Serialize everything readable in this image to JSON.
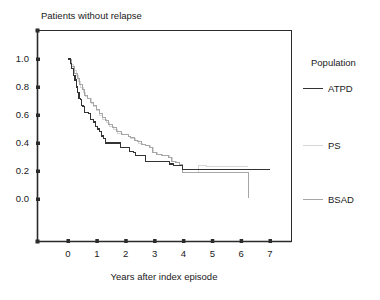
{
  "chart_data": {
    "type": "line",
    "title": "Patients without relapse",
    "xlabel": "Years after index episode",
    "ylabel": "",
    "xlim": [
      -0.45,
      7.8
    ],
    "ylim": [
      -0.18,
      1.25
    ],
    "grid": false,
    "legend_position": "right",
    "legend_title": "Population",
    "xticks": [
      0,
      1,
      2,
      3,
      4,
      5,
      6,
      7
    ],
    "xtick_labels": [
      "0",
      "1",
      "2",
      "3",
      "4",
      "5",
      "6",
      "7"
    ],
    "yticks": [
      0.0,
      0.2,
      0.4,
      0.6,
      0.8,
      1.0
    ],
    "ytick_labels": [
      "0.0",
      "0.2",
      "0.4",
      "0.6",
      "0.8",
      "1.0"
    ],
    "series": [
      {
        "name": "ATPD",
        "color": "#333333",
        "style": "step",
        "points": [
          [
            0.0,
            1.0
          ],
          [
            0.08,
            0.97
          ],
          [
            0.13,
            0.93
          ],
          [
            0.18,
            0.88
          ],
          [
            0.24,
            0.85
          ],
          [
            0.3,
            0.8
          ],
          [
            0.33,
            0.76
          ],
          [
            0.38,
            0.72
          ],
          [
            0.42,
            0.71
          ],
          [
            0.47,
            0.67
          ],
          [
            0.52,
            0.66
          ],
          [
            0.58,
            0.62
          ],
          [
            0.72,
            0.61
          ],
          [
            0.78,
            0.57
          ],
          [
            0.88,
            0.55
          ],
          [
            0.95,
            0.52
          ],
          [
            1.02,
            0.5
          ],
          [
            1.1,
            0.48
          ],
          [
            1.16,
            0.45
          ],
          [
            1.22,
            0.43
          ],
          [
            1.3,
            0.4
          ],
          [
            1.78,
            0.4
          ],
          [
            1.82,
            0.37
          ],
          [
            2.08,
            0.37
          ],
          [
            2.14,
            0.34
          ],
          [
            2.26,
            0.33
          ],
          [
            2.34,
            0.31
          ],
          [
            2.62,
            0.31
          ],
          [
            2.68,
            0.27
          ],
          [
            3.46,
            0.27
          ],
          [
            3.52,
            0.25
          ],
          [
            3.66,
            0.24
          ],
          [
            3.92,
            0.24
          ],
          [
            3.98,
            0.21
          ],
          [
            7.0,
            0.21
          ]
        ]
      },
      {
        "name": "PS",
        "color": "#d6d6d6",
        "style": "step",
        "points": [
          [
            0.0,
            1.0
          ],
          [
            0.1,
            0.96
          ],
          [
            0.2,
            0.92
          ],
          [
            0.28,
            0.88
          ],
          [
            0.36,
            0.84
          ],
          [
            0.44,
            0.8
          ],
          [
            0.52,
            0.76
          ],
          [
            0.6,
            0.73
          ],
          [
            0.68,
            0.72
          ],
          [
            0.8,
            0.68
          ],
          [
            0.9,
            0.66
          ],
          [
            1.0,
            0.63
          ],
          [
            1.1,
            0.6
          ],
          [
            1.2,
            0.57
          ],
          [
            1.32,
            0.55
          ],
          [
            1.44,
            0.52
          ],
          [
            1.56,
            0.5
          ],
          [
            1.7,
            0.47
          ],
          [
            1.88,
            0.46
          ],
          [
            2.1,
            0.45
          ],
          [
            2.18,
            0.43
          ],
          [
            2.34,
            0.42
          ],
          [
            2.44,
            0.4
          ],
          [
            2.58,
            0.39
          ],
          [
            2.7,
            0.38
          ],
          [
            2.86,
            0.37
          ],
          [
            2.96,
            0.33
          ],
          [
            3.1,
            0.32
          ],
          [
            3.26,
            0.31
          ],
          [
            3.5,
            0.3
          ],
          [
            3.62,
            0.27
          ],
          [
            3.76,
            0.26
          ],
          [
            3.88,
            0.25
          ],
          [
            3.98,
            0.19
          ],
          [
            4.4,
            0.19
          ],
          [
            4.52,
            0.24
          ],
          [
            4.7,
            0.24
          ],
          [
            4.8,
            0.23
          ],
          [
            6.25,
            0.23
          ]
        ]
      },
      {
        "name": "BSAD",
        "color": "#a6a6a6",
        "style": "step",
        "points": [
          [
            0.0,
            1.0
          ],
          [
            0.12,
            0.95
          ],
          [
            0.22,
            0.9
          ],
          [
            0.32,
            0.86
          ],
          [
            0.4,
            0.82
          ],
          [
            0.5,
            0.78
          ],
          [
            0.58,
            0.74
          ],
          [
            0.66,
            0.72
          ],
          [
            0.78,
            0.69
          ],
          [
            0.88,
            0.67
          ],
          [
            0.98,
            0.64
          ],
          [
            1.08,
            0.61
          ],
          [
            1.18,
            0.58
          ],
          [
            1.3,
            0.56
          ],
          [
            1.42,
            0.53
          ],
          [
            1.54,
            0.51
          ],
          [
            1.68,
            0.48
          ],
          [
            1.86,
            0.46
          ],
          [
            2.08,
            0.45
          ],
          [
            2.16,
            0.44
          ],
          [
            2.32,
            0.42
          ],
          [
            2.42,
            0.41
          ],
          [
            2.56,
            0.39
          ],
          [
            2.68,
            0.38
          ],
          [
            2.84,
            0.37
          ],
          [
            2.94,
            0.33
          ],
          [
            3.08,
            0.32
          ],
          [
            3.24,
            0.31
          ],
          [
            3.48,
            0.3
          ],
          [
            3.6,
            0.27
          ],
          [
            3.74,
            0.26
          ],
          [
            3.86,
            0.25
          ],
          [
            3.96,
            0.19
          ],
          [
            6.25,
            0.19
          ],
          [
            6.25,
            0.01
          ]
        ]
      }
    ],
    "annotations": []
  },
  "legend": {
    "title": "Population",
    "entries": [
      {
        "label": "ATPD",
        "color": "#333333"
      },
      {
        "label": "PS",
        "color": "#d6d6d6"
      },
      {
        "label": "BSAD",
        "color": "#a6a6a6"
      }
    ]
  },
  "axes": {
    "frame_color": "#2b2b2b",
    "tick_color": "#2b2b2b"
  }
}
